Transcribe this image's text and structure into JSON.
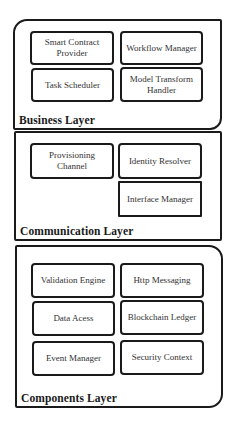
{
  "diagram": {
    "layers": [
      {
        "id": "business",
        "label": "Business Layer",
        "components": [
          "Smart Contract Provider",
          "Workflow Manager",
          "Task Scheduler",
          "Model Transform Handler"
        ]
      },
      {
        "id": "communication",
        "label": "Communication Layer",
        "components": [
          "Provisioning Channel",
          "Identity Resolver",
          "Interface Manager"
        ]
      },
      {
        "id": "components",
        "label": "Components Layer",
        "components": [
          "Validation Engine",
          "Http Messaging",
          "Data Acess",
          "Blockchain Ledger",
          "Event Manager",
          "Security Context"
        ]
      }
    ]
  }
}
